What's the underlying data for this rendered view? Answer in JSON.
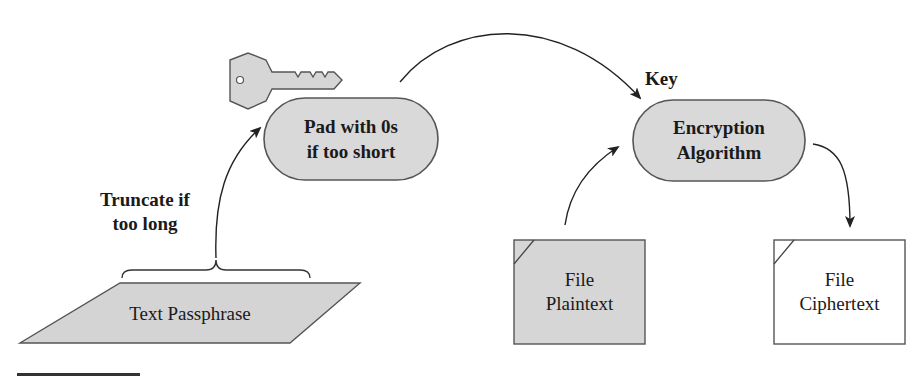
{
  "diagram": {
    "nodes": {
      "pad": {
        "line1": "Pad with 0s",
        "line2": "if too short",
        "fill": "#d9d9d9"
      },
      "encryption": {
        "line1": "Encryption",
        "line2": "Algorithm",
        "fill": "#d9d9d9"
      },
      "passphrase": {
        "label": "Text Passphrase",
        "fill": "#d4d4d4"
      },
      "plaintext": {
        "line1": "File",
        "line2": "Plaintext",
        "fill": "#d6d6d6"
      },
      "ciphertext": {
        "line1": "File",
        "line2": "Ciphertext",
        "fill": "#ffffff"
      }
    },
    "annotations": {
      "truncate_line1": "Truncate if",
      "truncate_line2": "too long",
      "key_label": "Key"
    },
    "icons": [
      "key-icon",
      "brace-icon"
    ],
    "colors": {
      "stroke": "#4a4a4a",
      "arrow": "#222222",
      "rule": "#333333"
    }
  }
}
